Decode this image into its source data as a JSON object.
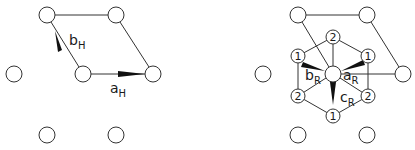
{
  "left_panel": {
    "name": "hexagonal-lattice",
    "vectors": [
      {
        "main": "b",
        "sub": "H"
      },
      {
        "main": "a",
        "sub": "H"
      }
    ]
  },
  "right_panel": {
    "name": "rhombohedral-lattice",
    "vectors": [
      {
        "main": "b",
        "sub": "R"
      },
      {
        "main": "a",
        "sub": "R"
      },
      {
        "main": "c",
        "sub": "R"
      }
    ],
    "site_labels": {
      "top": "2",
      "upper_left": "1",
      "upper_right": "1",
      "lower_left": "2",
      "lower_right": "2",
      "bottom": "1"
    }
  }
}
